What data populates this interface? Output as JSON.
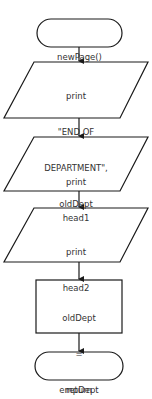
{
  "diagram": {
    "type": "flowchart",
    "nodes": [
      {
        "id": "start",
        "shape": "terminal",
        "lines": [
          "newPage()"
        ]
      },
      {
        "id": "print1",
        "shape": "parallelogram",
        "lines": [
          "print",
          "\"END OF",
          "DEPARTMENT\",",
          "oldDept"
        ]
      },
      {
        "id": "print2",
        "shape": "parallelogram",
        "lines": [
          "print",
          "head1"
        ]
      },
      {
        "id": "print3",
        "shape": "parallelogram",
        "lines": [
          "print",
          "head2"
        ]
      },
      {
        "id": "assign",
        "shape": "rectangle",
        "lines": [
          "oldDept",
          "=",
          "empDept"
        ]
      },
      {
        "id": "end",
        "shape": "terminal",
        "lines": [
          "return"
        ]
      }
    ],
    "edges": [
      [
        "start",
        "print1"
      ],
      [
        "print1",
        "print2"
      ],
      [
        "print2",
        "print3"
      ],
      [
        "print3",
        "assign"
      ],
      [
        "assign",
        "end"
      ]
    ],
    "colors": {
      "stroke": "#1a1a1a",
      "fill": "#ffffff",
      "text": "#333333"
    }
  }
}
